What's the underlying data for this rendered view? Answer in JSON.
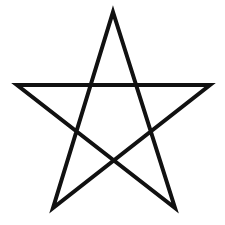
{
  "figure": {
    "shape": "pentagram",
    "stroke_color": "#111111",
    "stroke_width": 4,
    "background_color": "#ffffff",
    "points": "113,12 175,208 17,85 210,85 53,208"
  }
}
